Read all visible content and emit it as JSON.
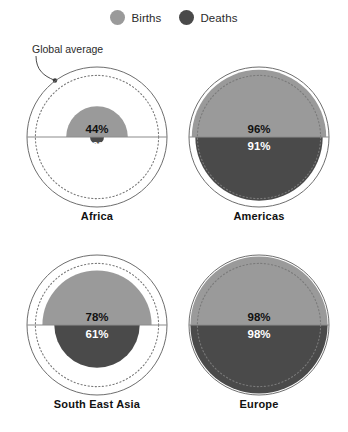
{
  "legend": {
    "items": [
      {
        "label": "Births",
        "color": "#9a9a9a",
        "icon": "circle-marker-births"
      },
      {
        "label": "Deaths",
        "color": "#4a4a4a",
        "icon": "circle-marker-deaths"
      }
    ]
  },
  "annotation": {
    "text": "Global average",
    "icon": "curved-leader-arrow"
  },
  "colors": {
    "births": "#9a9a9a",
    "deaths": "#4a4a4a",
    "outer_ring": "#6e6e6e",
    "dotted_ring": "#7a7a7a",
    "divider": "#8c8c8c",
    "background": "#ffffff"
  },
  "chart_data": {
    "type": "pie",
    "title": "",
    "subtitle": "",
    "xlabel": "",
    "ylabel": "",
    "legend_position": "top-center",
    "grid": false,
    "units": "percent",
    "value_range": [
      0,
      100
    ],
    "reference": {
      "label": "Global average",
      "births": 88,
      "deaths": 88
    },
    "series": [
      {
        "name": "Births",
        "color": "#9a9a9a",
        "values": [
          44,
          96,
          78,
          98
        ]
      },
      {
        "name": "Deaths",
        "color": "#4a4a4a",
        "values": [
          10,
          91,
          61,
          98
        ]
      }
    ],
    "categories": [
      "Africa",
      "Americas",
      "South East Asia",
      "Europe"
    ],
    "panels": [
      {
        "label": "Africa",
        "births": 44,
        "deaths": 10,
        "births_text": "44%",
        "deaths_text": "10%"
      },
      {
        "label": "Americas",
        "births": 96,
        "deaths": 91,
        "births_text": "96%",
        "deaths_text": "91%"
      },
      {
        "label": "South East Asia",
        "births": 78,
        "deaths": 61,
        "births_text": "78%",
        "deaths_text": "61%"
      },
      {
        "label": "Europe",
        "births": 98,
        "deaths": 98,
        "births_text": "98%",
        "deaths_text": "98%"
      }
    ]
  }
}
